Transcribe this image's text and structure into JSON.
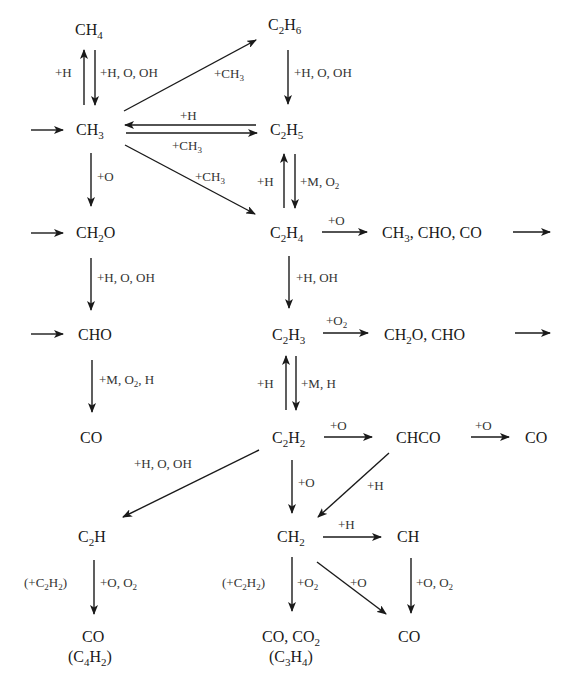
{
  "diagram": {
    "species": {
      "ch4": {
        "base": "CH",
        "sub": "4"
      },
      "c2h6": {
        "pre": "C",
        "sub1": "2",
        "mid": "H",
        "sub2": "6"
      },
      "ch3": {
        "base": "CH",
        "sub": "3"
      },
      "c2h5": {
        "pre": "C",
        "sub1": "2",
        "mid": "H",
        "sub2": "5"
      },
      "ch2o": {
        "pre": "CH",
        "sub": "2",
        "post": "O"
      },
      "c2h4": {
        "pre": "C",
        "sub1": "2",
        "mid": "H",
        "sub2": "4"
      },
      "c2h4_products": {
        "pre": "CH",
        "sub": "3",
        "post": ", CHO, CO"
      },
      "cho": {
        "text": "CHO"
      },
      "c2h3": {
        "pre": "C",
        "sub1": "2",
        "mid": "H",
        "sub2": "3"
      },
      "c2h3_products": {
        "pre": "CH",
        "sub": "2",
        "post": "O, CHO"
      },
      "co_left": {
        "text": "CO"
      },
      "c2h2": {
        "pre": "C",
        "sub1": "2",
        "mid": "H",
        "sub2": "2"
      },
      "chco": {
        "text": "CHCO"
      },
      "co_right": {
        "text": "CO"
      },
      "c2h": {
        "pre": "C",
        "sub": "2",
        "post": "H"
      },
      "ch2": {
        "pre": "CH",
        "sub": "2"
      },
      "ch": {
        "text": "CH"
      },
      "co_bottom_left": {
        "text": "CO"
      },
      "c4h2": {
        "open": "(C",
        "sub1": "4",
        "mid": "H",
        "sub2": "2",
        "close": ")"
      },
      "co_co2": {
        "pre": "CO, CO",
        "sub": "2"
      },
      "c3h4": {
        "open": "(C",
        "sub1": "3",
        "mid": "H",
        "sub2": "4",
        "close": ")"
      },
      "co_bottom_right": {
        "text": "CO"
      }
    },
    "labels": {
      "ch4_up": "+H",
      "ch4_down": "+H, O, OH",
      "ch3_to_c2h6": {
        "pre": "+CH",
        "sub": "3"
      },
      "c2h6_down": "+H, O, OH",
      "c2h5_to_ch3": "+H",
      "ch3_to_c2h5": {
        "pre": "+CH",
        "sub": "3"
      },
      "ch3_down": "+O",
      "ch3_to_c2h4": {
        "pre": "+CH",
        "sub": "3"
      },
      "c2h5_up": "+H",
      "c2h5_down": {
        "pre": "+M, O",
        "sub": "2"
      },
      "c2h4_right": "+O",
      "ch2o_down": "+H, O, OH",
      "c2h4_down": "+H, OH",
      "c2h3_right": {
        "pre": "+O",
        "sub": "2"
      },
      "cho_down": {
        "pre": "+M, O",
        "sub": "2",
        "post": ", H"
      },
      "c2h3_up": "+H",
      "c2h3_down": "+M, H",
      "c2h2_right": "+O",
      "chco_right": "+O",
      "c2h2_to_c2h": "+H, O, OH",
      "c2h2_down": "+O",
      "chco_to_ch2": "+H",
      "ch2_right": "+H",
      "c2h_down_left": {
        "open": "(+C",
        "sub1": "2",
        "mid": "H",
        "sub2": "2",
        "close": ")"
      },
      "c2h_down_right": {
        "pre": "+O, O",
        "sub": "2"
      },
      "ch2_down_left": {
        "open": "(+C",
        "sub1": "2",
        "mid": "H",
        "sub2": "2",
        "close": ")"
      },
      "ch2_down_right": {
        "pre": "+O",
        "sub": "2"
      },
      "ch2_to_co": "+O",
      "ch_down": {
        "pre": "+O, O",
        "sub": "2"
      }
    }
  }
}
